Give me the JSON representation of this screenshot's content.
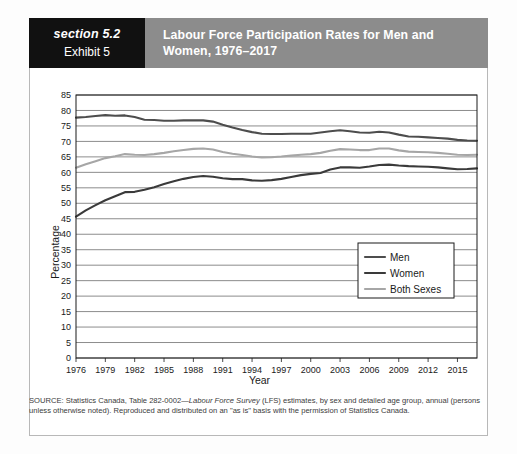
{
  "header": {
    "section_label": "section 5.2",
    "exhibit_label": "Exhibit 5",
    "title": "Labour Force Participation Rates for Men and Women, 1976–2017"
  },
  "source_note": {
    "prefix": "SOURCE: Statistics Canada, Table 282-0002—",
    "italic": "Labour Force Survey",
    "suffix": " (LFS) estimates, by sex and detailed age group, annual (persons unless otherwise noted). Reproduced and distributed on an \"as is\" basis with the permission of Statistics Canada."
  },
  "colors": {
    "section_block": "#111111",
    "title_block": "#8c8c8c",
    "panel_border": "#b8b8b8",
    "gridline": "#6e6e6e",
    "men": "#4d4d4d",
    "women": "#3a3a3a",
    "both_sexes": "#a6a6a6"
  },
  "chart_data": {
    "type": "line",
    "title": "Labour Force Participation Rates for Men and Women, 1976–2017",
    "xlabel": "Year",
    "ylabel": "Percentage",
    "ylim": [
      0,
      85
    ],
    "ytick_step": 5,
    "yticks": [
      0,
      5,
      10,
      15,
      20,
      25,
      30,
      35,
      40,
      45,
      50,
      55,
      60,
      65,
      70,
      75,
      80,
      85
    ],
    "xlim": [
      1976,
      2017
    ],
    "xticks": [
      1976,
      1979,
      1982,
      1985,
      1988,
      1991,
      1994,
      1997,
      2000,
      2003,
      2006,
      2009,
      2012,
      2015
    ],
    "grid": "horizontal",
    "legend_position": "center-right",
    "x": [
      1976,
      1977,
      1978,
      1979,
      1980,
      1981,
      1982,
      1983,
      1984,
      1985,
      1986,
      1987,
      1988,
      1989,
      1990,
      1991,
      1992,
      1993,
      1994,
      1995,
      1996,
      1997,
      1998,
      1999,
      2000,
      2001,
      2002,
      2003,
      2004,
      2005,
      2006,
      2007,
      2008,
      2009,
      2010,
      2011,
      2012,
      2013,
      2014,
      2015,
      2016,
      2017
    ],
    "series": [
      {
        "name": "Men",
        "color": "#4d4d4d",
        "values": [
          77.7,
          77.9,
          78.2,
          78.5,
          78.3,
          78.4,
          77.9,
          77.0,
          76.9,
          76.7,
          76.7,
          76.8,
          76.8,
          76.8,
          76.4,
          75.4,
          74.5,
          73.7,
          73.0,
          72.5,
          72.4,
          72.4,
          72.5,
          72.5,
          72.5,
          72.9,
          73.3,
          73.6,
          73.3,
          72.9,
          72.8,
          73.1,
          72.9,
          72.2,
          71.6,
          71.5,
          71.3,
          71.1,
          70.9,
          70.5,
          70.3,
          70.2
        ]
      },
      {
        "name": "Women",
        "color": "#3a3a3a",
        "values": [
          45.7,
          47.7,
          49.4,
          51.0,
          52.3,
          53.6,
          53.7,
          54.4,
          55.2,
          56.2,
          57.1,
          57.9,
          58.5,
          58.8,
          58.6,
          58.1,
          57.8,
          57.8,
          57.4,
          57.3,
          57.5,
          57.9,
          58.5,
          59.1,
          59.5,
          59.8,
          60.9,
          61.6,
          61.6,
          61.5,
          61.9,
          62.4,
          62.5,
          62.2,
          62.0,
          61.9,
          61.8,
          61.6,
          61.3,
          61.0,
          61.1,
          61.3
        ]
      },
      {
        "name": "Both Sexes",
        "color": "#a6a6a6",
        "values": [
          61.5,
          62.6,
          63.6,
          64.6,
          65.2,
          65.9,
          65.7,
          65.6,
          65.9,
          66.3,
          66.8,
          67.2,
          67.6,
          67.7,
          67.4,
          66.6,
          66.0,
          65.6,
          65.1,
          64.8,
          64.9,
          65.1,
          65.4,
          65.7,
          65.9,
          66.3,
          67.0,
          67.5,
          67.4,
          67.2,
          67.2,
          67.7,
          67.7,
          67.1,
          66.7,
          66.6,
          66.5,
          66.3,
          66.0,
          65.7,
          65.6,
          65.7
        ]
      }
    ],
    "legend": [
      {
        "label": "Men",
        "color": "#4d4d4d"
      },
      {
        "label": "Women",
        "color": "#3a3a3a"
      },
      {
        "label": "Both Sexes",
        "color": "#a6a6a6"
      }
    ]
  }
}
